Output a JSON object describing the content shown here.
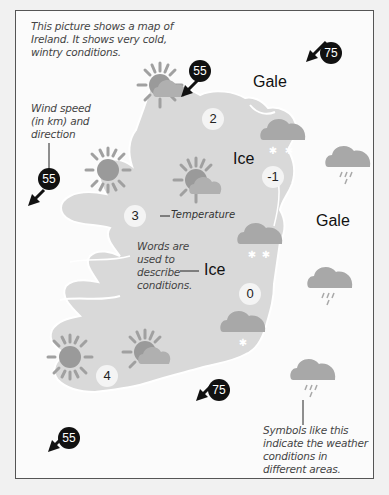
{
  "captions": {
    "intro": [
      "This picture shows a map of",
      "Ireland. It shows very cold,",
      "wintry conditions."
    ],
    "wind_note": [
      "Wind speed",
      "(in km) and",
      "direction"
    ],
    "words_note": [
      "Words are",
      "used to",
      "describe",
      "conditions."
    ],
    "symbols_note": [
      "Symbols like this",
      "indicate the weather",
      "conditions in",
      "different areas."
    ],
    "temperature_note": "Temperature"
  },
  "conditions": {
    "gale_north": "Gale",
    "gale_east": "Gale",
    "ice_center": "Ice",
    "ice_label": "Ice"
  },
  "temperatures": {
    "north": "2",
    "northeast": "-1",
    "west": "3",
    "east": "0",
    "southwest": "4"
  },
  "winds": {
    "north": "55",
    "northeast": "75",
    "west": "55",
    "south": "75",
    "southwest": "55"
  },
  "colors": {
    "land": "#d9d9d9",
    "sea": "#fbfbfb",
    "sun": "#9a9a9a",
    "cloud": "#a8a8a8",
    "wind_marker": "#111111"
  }
}
